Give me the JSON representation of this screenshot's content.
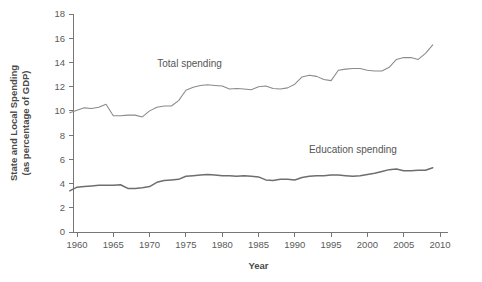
{
  "chart_data": {
    "type": "line",
    "title": "",
    "xlabel": "Year",
    "ylabel": "State and Local Spending (as percentage of GDP)",
    "ylabel_line1": "State and Local Spending",
    "ylabel_line2": "(as percentage of GDP)",
    "xlim": [
      1959,
      2010
    ],
    "ylim": [
      0,
      18
    ],
    "grid": false,
    "legend_position": "inline-annotation",
    "xticks": [
      1960,
      1965,
      1970,
      1975,
      1980,
      1985,
      1990,
      1995,
      2000,
      2005,
      2010
    ],
    "xtick_labels": [
      "1960",
      "1965",
      "1970",
      "1975",
      "1980",
      "1985",
      "1990",
      "1995",
      "2000",
      "2005",
      "2010"
    ],
    "yticks": [
      0,
      2,
      4,
      6,
      8,
      10,
      12,
      14,
      16,
      18
    ],
    "ytick_labels": [
      "0",
      "2",
      "4",
      "6",
      "8",
      "10",
      "12",
      "14",
      "16",
      "18"
    ],
    "annotations": [
      {
        "text": "Total spending",
        "x": 1975.5,
        "y": 13.6
      },
      {
        "text": "Education spending",
        "x": 1998.0,
        "y": 6.5
      }
    ],
    "x": [
      1959,
      1960,
      1961,
      1962,
      1963,
      1964,
      1965,
      1966,
      1967,
      1968,
      1969,
      1970,
      1971,
      1972,
      1973,
      1974,
      1975,
      1976,
      1977,
      1978,
      1979,
      1980,
      1981,
      1982,
      1983,
      1984,
      1985,
      1986,
      1987,
      1988,
      1989,
      1990,
      1991,
      1992,
      1993,
      1994,
      1995,
      1996,
      1997,
      1998,
      1999,
      2000,
      2001,
      2002,
      2003,
      2004,
      2005,
      2006,
      2007,
      2008,
      2009
    ],
    "series": [
      {
        "name": "Total spending",
        "color": "#8a8a8a",
        "values": [
          9.85,
          10.05,
          10.25,
          10.2,
          10.3,
          10.55,
          9.6,
          9.6,
          9.65,
          9.65,
          9.5,
          10.0,
          10.3,
          10.4,
          10.4,
          10.85,
          11.7,
          11.95,
          12.1,
          12.15,
          12.1,
          12.05,
          11.8,
          11.85,
          11.8,
          11.75,
          12.0,
          12.05,
          11.85,
          11.8,
          11.9,
          12.2,
          12.8,
          12.95,
          12.85,
          12.6,
          12.5,
          13.35,
          13.45,
          13.5,
          13.5,
          13.35,
          13.3,
          13.3,
          13.6,
          14.25,
          14.4,
          14.4,
          14.25,
          14.75,
          15.45
        ]
      },
      {
        "name": "Education spending",
        "color": "#6e6e6e",
        "values": [
          3.4,
          3.7,
          3.75,
          3.8,
          3.85,
          3.85,
          3.85,
          3.9,
          3.6,
          3.6,
          3.65,
          3.75,
          4.1,
          4.25,
          4.3,
          4.35,
          4.6,
          4.65,
          4.7,
          4.75,
          4.7,
          4.65,
          4.65,
          4.6,
          4.65,
          4.6,
          4.55,
          4.3,
          4.25,
          4.35,
          4.35,
          4.3,
          4.5,
          4.6,
          4.65,
          4.65,
          4.7,
          4.7,
          4.65,
          4.6,
          4.65,
          4.75,
          4.85,
          5.0,
          5.15,
          5.2,
          5.05,
          5.05,
          5.1,
          5.1,
          5.3
        ]
      }
    ]
  }
}
